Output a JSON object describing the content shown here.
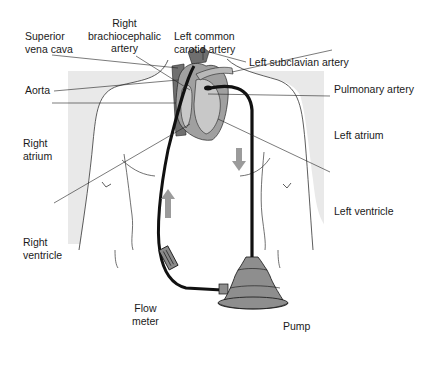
{
  "diagram": {
    "type": "anatomical-schematic",
    "colors": {
      "background": "#ffffff",
      "body_shading": "#e8e8e8",
      "heart_fill": "#9a9a9a",
      "heart_light": "#c4c4c4",
      "vessel_dark": "#6e6e6e",
      "tube": "#111111",
      "pump_fill": "#8e8e8e",
      "arrow": "#9b9b9b",
      "line": "#222222"
    },
    "labels": {
      "superior_vena_cava": "Superior\nvena cava",
      "right_brachiocephalic_artery": "Right\nbrachiocephalic\nartery",
      "left_common_carotid_artery": "Left common\ncarotid artery",
      "left_subclavian_artery": "Left subclavian artery",
      "aorta": "Aorta",
      "pulmonary_artery": "Pulmonary artery",
      "right_atrium": "Right\natrium",
      "left_atrium": "Left atrium",
      "left_ventricle": "Left ventricle",
      "right_ventricle": "Right\nventricle",
      "flow_meter": "Flow\nmeter",
      "pump": "Pump"
    },
    "flow_arrows": [
      {
        "direction": "down",
        "position": "right tube (outflow from left ventricle to pump)"
      },
      {
        "direction": "up",
        "position": "left tube (return from pump to aorta)"
      }
    ]
  }
}
